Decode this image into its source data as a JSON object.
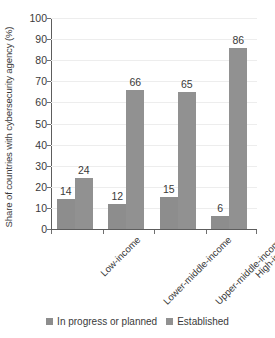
{
  "chart_data": {
    "type": "bar",
    "title": "",
    "xlabel": "",
    "ylabel": "Share of countries with cybersecurity agency (%)",
    "ylim": [
      0,
      100
    ],
    "ytick_step": 10,
    "yticks": [
      "100",
      "90",
      "80",
      "70",
      "60",
      "50",
      "40",
      "30",
      "20",
      "10",
      "0"
    ],
    "grid": true,
    "legend_position": "bottom-center",
    "categories": [
      "Low-income",
      "Lower-middle-income",
      "Upper-middle-income",
      "High-income"
    ],
    "series": [
      {
        "name": "In progress or planned",
        "color": "#8d8d8d",
        "values": [
          14,
          12,
          15,
          6
        ]
      },
      {
        "name": "Established",
        "color": "#919191",
        "values": [
          24,
          66,
          65,
          86
        ]
      }
    ]
  },
  "legend": {
    "items": [
      {
        "label": "In progress or planned",
        "swatch": "#8d8d8d"
      },
      {
        "label": "Established",
        "swatch": "#919191"
      }
    ]
  },
  "colors": {
    "bar_gray": "#8f8f8f",
    "axis": "#5d5d5d",
    "grid": "#ededed",
    "text": "#3a3a3a",
    "background": "#ffffff"
  }
}
